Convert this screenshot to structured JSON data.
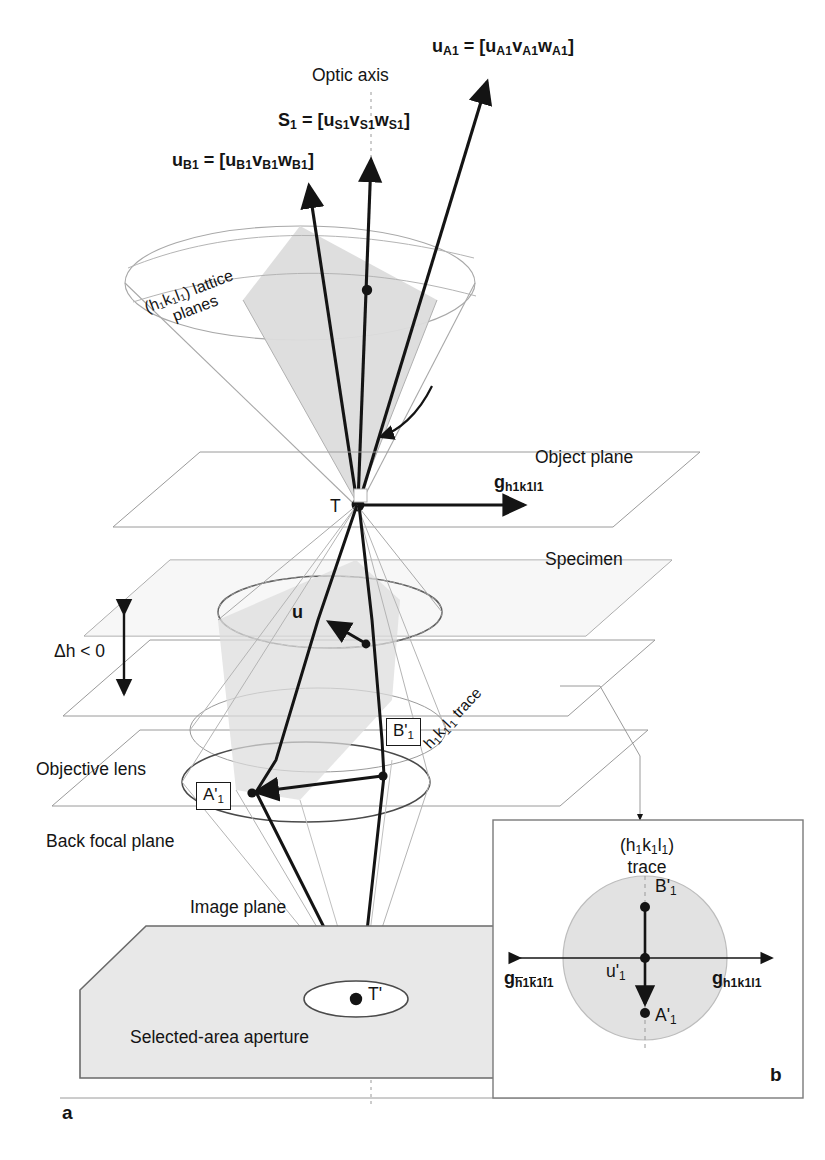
{
  "figure": {
    "type": "tem-ray-diagram",
    "title_visible": false,
    "panels": [
      {
        "id": "a",
        "label": "a"
      },
      {
        "id": "b",
        "label": "b"
      }
    ],
    "colors": {
      "ink": "#141414",
      "construction_line": "#9a9a9a",
      "wedge_fill": "#dcdcdc",
      "plate_fill": "#e8e8e8",
      "disc_fill": "#e2e2e2",
      "background": "#ffffff"
    }
  },
  "vectors": {
    "u_A1": {
      "name": "u",
      "name_sub": "A1",
      "equals": "=",
      "bracket_open": "[",
      "components": "u",
      "comp_sub_1": "A1",
      "comp_2": "v",
      "comp_sub_2": "A1",
      "comp_3": "w",
      "comp_sub_3": "A1",
      "bracket_close": "]",
      "full_text": "uA1 = [uA1vA1wA1]"
    },
    "s_1": {
      "name": "S",
      "name_sub": "1",
      "full_text": "S1 = [uS1vS1wS1]"
    },
    "u_B1": {
      "name": "u",
      "name_sub": "B1",
      "full_text": "uB1 = [uB1vB1wB1]"
    },
    "u_specimen": {
      "label": "u"
    }
  },
  "labels": {
    "optic_axis": "Optic axis",
    "lattice_planes_line1": "(h₁k₁l₁) lattice",
    "lattice_planes_line2": "planes",
    "object_plane": "Object plane",
    "specimen": "Specimen",
    "objective_lens": "Objective lens",
    "back_focal_plane": "Back focal plane",
    "image_plane": "Image plane",
    "selected_area_aperture": "Selected-area aperture",
    "delta_h": "Δh < 0",
    "origin_T": "T",
    "image_T_prime": "T'",
    "trace_main": "h₁k₁l₁ trace",
    "g_vector_main": {
      "symbol": "g",
      "subscript": "h1k1l1"
    },
    "point_A_prime": {
      "symbol": "A'",
      "subscript": "1"
    },
    "point_B_prime": {
      "symbol": "B'",
      "subscript": "1"
    }
  },
  "inset": {
    "panel_label": "b",
    "title_line1": "(h₁k₁l₁)",
    "title_line2": "trace",
    "point_B": {
      "symbol": "B'",
      "subscript": "1"
    },
    "point_A": {
      "symbol": "A'",
      "subscript": "1"
    },
    "vector_u": {
      "symbol": "u'",
      "subscript": "1"
    },
    "g_right": {
      "symbol": "g",
      "subscript": "h1k1l1",
      "overbars": false
    },
    "g_left": {
      "symbol": "g",
      "subscript": "h1k1l1",
      "overbars": true
    }
  },
  "panel_a_label": "a"
}
